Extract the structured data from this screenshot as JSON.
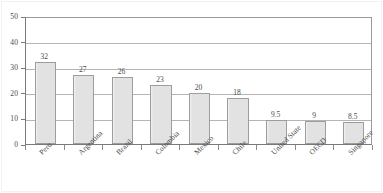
{
  "chart_data": {
    "type": "bar",
    "title": "",
    "subtitle": "",
    "xlabel": "",
    "ylabel": "",
    "ylim": [
      0,
      50
    ],
    "yticks": [
      0,
      10,
      20,
      30,
      40,
      50
    ],
    "ytick_labels": [
      "0",
      "10",
      "20",
      "30",
      "40",
      "50"
    ],
    "grid": true,
    "grid_axis": "y",
    "legend": false,
    "legend_position": "none",
    "categories": [
      "Peru",
      "Argentina",
      "Brazil",
      "Colombia",
      "Mexico",
      "Chile",
      "United State",
      "OECD",
      "Singapore"
    ],
    "values": [
      32,
      27,
      26,
      23,
      20,
      18,
      9.5,
      9,
      8.5
    ],
    "value_labels": [
      "32",
      "27",
      "26",
      "23",
      "20",
      "18",
      "9.5",
      "9",
      "8.5"
    ],
    "bar_fill_color": "#e2e2e2",
    "bar_border_color": "#9d9d9d",
    "gridline_color": "#b5b5b5",
    "axis_color": "#7a7a7a",
    "text_color": "#4a4a4a",
    "background_color": "#ffffff"
  }
}
